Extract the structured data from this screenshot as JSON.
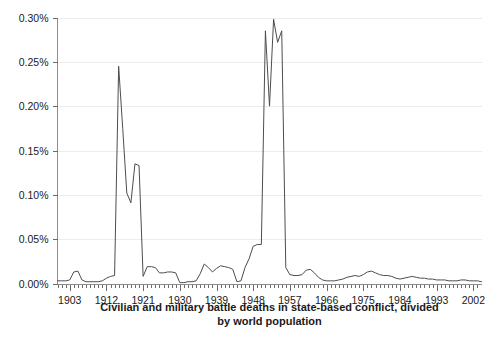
{
  "chart_data": {
    "type": "line",
    "title": "",
    "caption_lines": [
      "Civilian and military battle deaths in state-based conflict, divided",
      "by world population"
    ],
    "xlabel": "",
    "ylabel": "",
    "xlim": [
      1900,
      2004
    ],
    "ylim": [
      0.0,
      0.3
    ],
    "grid": true,
    "legend": false,
    "y_tick_labels": [
      "0.00%",
      "0.05%",
      "0.10%",
      "0.15%",
      "0.20%",
      "0.25%",
      "0.30%"
    ],
    "y_tick_values": [
      0.0,
      0.05,
      0.1,
      0.15,
      0.2,
      0.25,
      0.3
    ],
    "x_tick_labels": [
      "1903",
      "1912",
      "1921",
      "1930",
      "1939",
      "1948",
      "1957",
      "1966",
      "1975",
      "1984",
      "1993",
      "2002"
    ],
    "x_tick_values": [
      1903,
      1912,
      1921,
      1930,
      1939,
      1948,
      1957,
      1966,
      1975,
      1984,
      1993,
      2002
    ],
    "x_minor_tick_step": 1,
    "series": [
      {
        "name": "Battle deaths as share of world population",
        "units": "percent",
        "x": [
          1900,
          1901,
          1902,
          1903,
          1904,
          1905,
          1906,
          1907,
          1908,
          1909,
          1910,
          1911,
          1912,
          1913,
          1914,
          1915,
          1916,
          1917,
          1918,
          1919,
          1920,
          1921,
          1922,
          1923,
          1924,
          1925,
          1926,
          1927,
          1928,
          1929,
          1930,
          1931,
          1932,
          1933,
          1934,
          1935,
          1936,
          1937,
          1938,
          1939,
          1940,
          1941,
          1942,
          1943,
          1944,
          1945,
          1946,
          1947,
          1948,
          1949,
          1950,
          1951,
          1952,
          1953,
          1954,
          1955,
          1956,
          1957,
          1958,
          1959,
          1960,
          1961,
          1962,
          1963,
          1964,
          1965,
          1966,
          1967,
          1968,
          1969,
          1970,
          1971,
          1972,
          1973,
          1974,
          1975,
          1976,
          1977,
          1978,
          1979,
          1980,
          1981,
          1982,
          1983,
          1984,
          1985,
          1986,
          1987,
          1988,
          1989,
          1990,
          1991,
          1992,
          1993,
          1994,
          1995,
          1996,
          1997,
          1998,
          1999,
          2000,
          2001,
          2002,
          2003,
          2004
        ],
        "y": [
          0.003,
          0.003,
          0.003,
          0.004,
          0.013,
          0.014,
          0.004,
          0.002,
          0.002,
          0.002,
          0.002,
          0.003,
          0.006,
          0.008,
          0.009,
          0.245,
          0.175,
          0.102,
          0.091,
          0.135,
          0.133,
          0.008,
          0.019,
          0.019,
          0.018,
          0.012,
          0.012,
          0.013,
          0.013,
          0.012,
          0.001,
          0.001,
          0.002,
          0.002,
          0.003,
          0.011,
          0.022,
          0.018,
          0.013,
          0.017,
          0.02,
          0.019,
          0.018,
          0.016,
          0.002,
          0.003,
          0.018,
          0.028,
          0.042,
          0.044,
          0.044,
          0.285,
          0.2,
          0.298,
          0.272,
          0.285,
          0.018,
          0.01,
          0.009,
          0.009,
          0.01,
          0.015,
          0.016,
          0.012,
          0.007,
          0.004,
          0.003,
          0.003,
          0.003,
          0.004,
          0.005,
          0.007,
          0.008,
          0.009,
          0.008,
          0.01,
          0.013,
          0.014,
          0.012,
          0.01,
          0.009,
          0.009,
          0.008,
          0.006,
          0.005,
          0.006,
          0.007,
          0.008,
          0.007,
          0.006,
          0.006,
          0.005,
          0.005,
          0.004,
          0.004,
          0.004,
          0.003,
          0.003,
          0.003,
          0.004,
          0.004,
          0.003,
          0.003,
          0.003,
          0.002
        ],
        "color": "#4d4d4d"
      }
    ],
    "peaks": [
      {
        "label": "World War I peak",
        "year": 1915,
        "value": 0.245
      },
      {
        "label": "World War I second peak",
        "year": 1919,
        "value": 0.135
      },
      {
        "label": "World War II peak",
        "year": 1943,
        "value": 0.298
      }
    ],
    "colors": {
      "line": "#4d4d4d",
      "grid": "#ececec",
      "axis": "#8c8c8c",
      "tick": "#6b6b6b",
      "text": "#1a1a1a",
      "background": "#ffffff"
    }
  }
}
